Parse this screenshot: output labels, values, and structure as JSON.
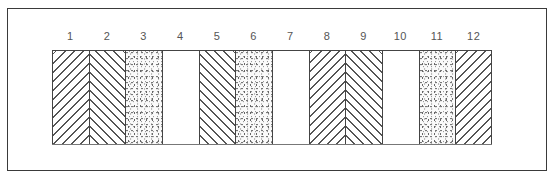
{
  "diagram": {
    "type": "hatch-pattern-strip",
    "column_count": 12,
    "columns": [
      {
        "label": "1",
        "pattern": "hatch-forward"
      },
      {
        "label": "2",
        "pattern": "hatch-backward"
      },
      {
        "label": "3",
        "pattern": "stipple"
      },
      {
        "label": "4",
        "pattern": "blank"
      },
      {
        "label": "5",
        "pattern": "hatch-backward"
      },
      {
        "label": "6",
        "pattern": "stipple"
      },
      {
        "label": "7",
        "pattern": "blank"
      },
      {
        "label": "8",
        "pattern": "hatch-forward"
      },
      {
        "label": "9",
        "pattern": "hatch-backward"
      },
      {
        "label": "10",
        "pattern": "blank"
      },
      {
        "label": "11",
        "pattern": "stipple"
      },
      {
        "label": "12",
        "pattern": "hatch-forward"
      }
    ],
    "colors": {
      "line": "#555555",
      "border": "#3a3a3a",
      "background": "#ffffff"
    }
  }
}
